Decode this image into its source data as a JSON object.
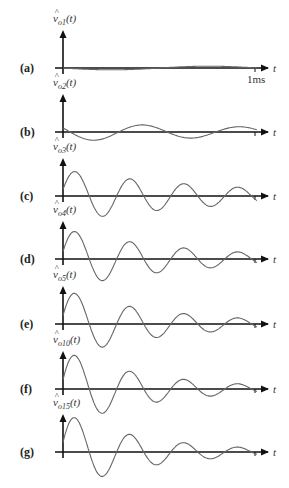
{
  "figure": {
    "x_axis_label": "t",
    "time_marker": "1ms",
    "panels": [
      {
        "id": "a",
        "label": "(a)",
        "signal": "v̂o1(t)",
        "hat": "^",
        "var": "v",
        "sub": "o1",
        "arg": "(t)",
        "axis_y": 68,
        "amp": 2,
        "freq": 1.0,
        "damp": 0.0,
        "phase": 0.0
      },
      {
        "id": "b",
        "label": "(b)",
        "signal": "v̂o2(t)",
        "hat": "^",
        "var": "v",
        "sub": "o2",
        "arg": "(t)",
        "axis_y": 132,
        "amp": 9,
        "freq": 2.0,
        "damp": 0.6,
        "phase": 0.0
      },
      {
        "id": "c",
        "label": "(c)",
        "signal": "v̂o3(t)",
        "hat": "^",
        "var": "v",
        "sub": "o3",
        "arg": "(t)",
        "axis_y": 196,
        "amp": 26,
        "freq": 3.6,
        "damp": 1.2,
        "phase": 0.0
      },
      {
        "id": "d",
        "label": "(d)",
        "signal": "v̂o4(t)",
        "hat": "^",
        "var": "v",
        "sub": "o4",
        "arg": "(t)",
        "axis_y": 259,
        "amp": 30,
        "freq": 3.6,
        "damp": 1.6,
        "phase": 0.0
      },
      {
        "id": "e",
        "label": "(e)",
        "signal": "v̂o5(t)",
        "hat": "^",
        "var": "v",
        "sub": "o5",
        "arg": "(t)",
        "axis_y": 324,
        "amp": 34,
        "freq": 3.6,
        "damp": 1.9,
        "phase": 0.0
      },
      {
        "id": "f",
        "label": "(f)",
        "signal": "v̂o10(t)",
        "hat": "^",
        "var": "v",
        "sub": "o10",
        "arg": "(t)",
        "axis_y": 389,
        "amp": 38,
        "freq": 3.6,
        "damp": 2.2,
        "phase": 0.0
      },
      {
        "id": "g",
        "label": "(g)",
        "signal": "v̂o15(t)",
        "hat": "^",
        "var": "v",
        "sub": "o15",
        "arg": "(t)",
        "axis_y": 452,
        "amp": 39,
        "freq": 3.6,
        "damp": 2.3,
        "phase": 0.0
      }
    ]
  },
  "chart_data": {
    "type": "line",
    "title": "",
    "xlabel": "t",
    "x_range_label": "0 to 1ms",
    "series": [
      {
        "name": "v̂o1(t)",
        "description": "nearly flat, tiny slow oscillation"
      },
      {
        "name": "v̂o2(t)",
        "description": "small slow damped oscillation"
      },
      {
        "name": "v̂o3(t)",
        "description": "damped oscillation, ~3.5 cycles"
      },
      {
        "name": "v̂o4(t)",
        "description": "damped oscillation, larger initial peak"
      },
      {
        "name": "v̂o5(t)",
        "description": "damped oscillation"
      },
      {
        "name": "v̂o10(t)",
        "description": "damped oscillation, sharper initial peak"
      },
      {
        "name": "v̂o15(t)",
        "description": "damped oscillation, sharpest initial peak"
      }
    ]
  }
}
